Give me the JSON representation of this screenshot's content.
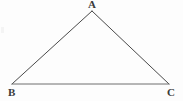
{
  "figure": {
    "kind": "geometry-diagram",
    "shape": "triangle",
    "width": 183,
    "height": 101,
    "background_color": "#fdfdfd",
    "stroke_color": "#4a4a4a",
    "base_stroke_color": "#6e6e6e",
    "stroke_width": 1,
    "label_color": "#3a3a3a",
    "vertices": [
      {
        "id": "A",
        "label": "A",
        "x": 92,
        "y": 11,
        "label_x": 88,
        "label_y": -1,
        "position": "apex-top"
      },
      {
        "id": "B",
        "label": "B",
        "x": 12,
        "y": 84,
        "label_x": 8,
        "label_y": 87,
        "position": "bottom-left"
      },
      {
        "id": "C",
        "label": "C",
        "x": 169,
        "y": 84,
        "label_x": 167,
        "label_y": 87,
        "position": "bottom-right"
      }
    ],
    "edges": [
      {
        "id": "AB",
        "from": "A",
        "to": "B",
        "stroke": "#4a4a4a"
      },
      {
        "id": "AC",
        "from": "A",
        "to": "C",
        "stroke": "#4a4a4a"
      },
      {
        "id": "BC",
        "from": "B",
        "to": "C",
        "stroke": "#6e6e6e"
      }
    ]
  }
}
